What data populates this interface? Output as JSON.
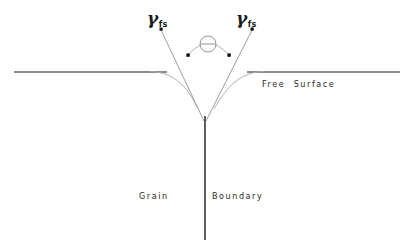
{
  "figure": {
    "background_color": "#ffffff",
    "line_color": "#1a1a1a",
    "curve_color": "#9a9a9a",
    "width": 410,
    "height": 248
  },
  "labels": {
    "gamma_left": {
      "symbol": "γ",
      "subscript": "fs"
    },
    "gamma_right": {
      "symbol": "γ",
      "subscript": "fs"
    },
    "free_surface": "Free  Surface",
    "grain": "Grain",
    "boundary": "Boundary"
  },
  "geometry": {
    "free_surface_left": {
      "x1": 14,
      "y1": 72,
      "x2": 166,
      "y2": 72
    },
    "free_surface_right": {
      "x1": 248,
      "y1": 72,
      "x2": 400,
      "y2": 72
    },
    "grain_boundary_line": {
      "x1": 205,
      "y1": 116,
      "x2": 205,
      "y2": 240
    },
    "groove_vertex": {
      "x": 205,
      "y": 119
    },
    "groove_left_arm": {
      "x1": 163,
      "y1": 29,
      "x2": 205,
      "y2": 119
    },
    "groove_right_arm": {
      "x1": 250,
      "y1": 29,
      "x2": 205,
      "y2": 119
    },
    "angle_marker_circle": {
      "cx": 208,
      "cy": 44,
      "r": 8
    },
    "angle_arc_endpoints": [
      {
        "x": 188,
        "y": 55
      },
      {
        "x": 229,
        "y": 55
      }
    ],
    "arrow_dots": [
      {
        "x": 161,
        "y": 29
      },
      {
        "x": 188,
        "y": 55
      },
      {
        "x": 229,
        "y": 55
      },
      {
        "x": 252,
        "y": 29
      }
    ]
  }
}
